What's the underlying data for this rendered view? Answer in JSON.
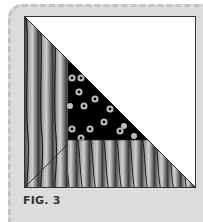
{
  "figure": {
    "caption": "FIG. 3",
    "colors": {
      "background": "#dcdcdc",
      "border_dashes": "#c4c4c4",
      "white_triangle": "#ffffff",
      "stripe_dark": "#3a3a3a",
      "stripe_light": "#b5b5b5",
      "dots_background": "#000000",
      "dot_color": "#bdbdbd",
      "outline": "#222222"
    }
  }
}
